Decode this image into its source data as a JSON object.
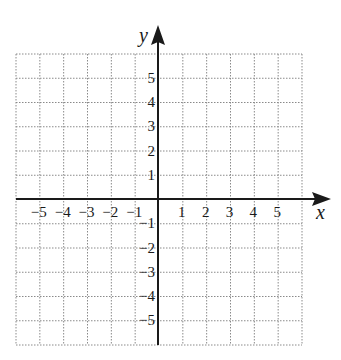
{
  "diagram": {
    "type": "coordinate-grid",
    "x_axis_label": "x",
    "y_axis_label": "y",
    "x_range": [
      -6,
      6
    ],
    "y_range": [
      -6,
      6
    ],
    "x_ticks_negative": [
      "−5",
      "−4",
      "−3",
      "−2",
      "−1"
    ],
    "x_ticks_positive": [
      "1",
      "2",
      "3",
      "4",
      "5"
    ],
    "y_ticks_positive": [
      "5",
      "4",
      "3",
      "2",
      "1"
    ],
    "y_ticks_negative": [
      "−1",
      "−2",
      "−3",
      "−4",
      "−5"
    ],
    "colors": {
      "axis": "#1a1a1a",
      "grid": "#8a8a8a",
      "background": "#ffffff"
    }
  }
}
